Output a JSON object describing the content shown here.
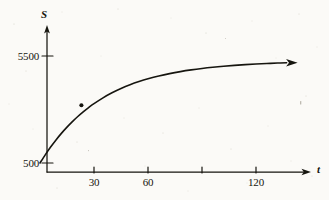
{
  "figure": {
    "kind": "scanned-textbook-graph",
    "background_color": "#fbfaf7",
    "ink_color": "#16150f"
  },
  "axes": {
    "y": {
      "label": "S",
      "label_style": "italic",
      "arrow": "up",
      "tick_labels": [
        "5500",
        "500"
      ]
    },
    "x": {
      "label": "t",
      "label_style": "italic",
      "arrow": "right",
      "tick_labels": [
        "30",
        "60",
        "120"
      ]
    }
  },
  "chart_data": {
    "type": "line",
    "title": "",
    "xlabel": "t",
    "ylabel": "S",
    "xlim": [
      0,
      140
    ],
    "ylim": [
      0,
      6200
    ],
    "grid": false,
    "legend": null,
    "xticks": [
      30,
      60,
      90,
      120
    ],
    "xticklabels": [
      "30",
      "60",
      "",
      "120"
    ],
    "yticks": [
      500,
      5500
    ],
    "yticklabels": [
      "500",
      "5500"
    ],
    "asymptote": 5500,
    "initial_value": 500,
    "annotations": [
      {
        "name": "curve-point-marker",
        "type": "point",
        "x": 23,
        "y": 3200,
        "label": ""
      }
    ],
    "series": [
      {
        "name": "S(t)",
        "arrow_end": true,
        "x": [
          0,
          3,
          6,
          9,
          12,
          15,
          18,
          21,
          24,
          27,
          30,
          35,
          40,
          45,
          50,
          55,
          60,
          66,
          72,
          78,
          84,
          90,
          96,
          102,
          108,
          114,
          120,
          126,
          132,
          137
        ],
        "y": [
          500,
          894,
          1256,
          1590,
          1896,
          2177,
          2435,
          2672,
          2890,
          3090,
          3273,
          3546,
          3781,
          3982,
          4156,
          4305,
          4434,
          4566,
          4677,
          4771,
          4850,
          4917,
          4974,
          5022,
          5062,
          5097,
          5126,
          5150,
          5171,
          5185
        ]
      }
    ]
  }
}
